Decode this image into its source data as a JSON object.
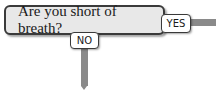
{
  "flowchart": {
    "question": "Are you short of breath?",
    "yes_label": "YES",
    "no_label": "NO",
    "colors": {
      "box_fill": "#e8e8e8",
      "border": "#3a3a3a",
      "connector": "#8a8a8a"
    }
  }
}
